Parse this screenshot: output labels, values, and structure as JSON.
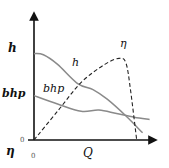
{
  "diagram": {
    "x_axis_label": "Q",
    "x_origin_label": "0",
    "y_axis_labels": {
      "h": "h",
      "bhp": "bhp",
      "eta": "η",
      "origin": "0"
    },
    "curve_labels": {
      "h": "h",
      "bhp": "bhp",
      "eta": "η"
    },
    "colors": {
      "axis": "#111111",
      "curve": "#8a8a8a",
      "eta_curve": "#222222"
    }
  },
  "chart_data": {
    "type": "line",
    "title": "",
    "xlabel": "Q",
    "ylabel": "",
    "xlim": [
      0,
      1
    ],
    "ylim": [
      0,
      1
    ],
    "grid": false,
    "series": [
      {
        "name": "h",
        "style": "solid",
        "x": [
          0,
          0.08,
          0.2,
          0.37,
          0.5,
          0.62,
          0.78,
          0.92
        ],
        "y": [
          0.72,
          0.71,
          0.63,
          0.47,
          0.42,
          0.34,
          0.2,
          0.06
        ]
      },
      {
        "name": "bhp",
        "style": "solid",
        "x": [
          0,
          0.2,
          0.4,
          0.55,
          0.7,
          0.85,
          0.98
        ],
        "y": [
          0.37,
          0.3,
          0.24,
          0.25,
          0.22,
          0.19,
          0.17
        ]
      },
      {
        "name": "η",
        "style": "dashed",
        "x": [
          0,
          0.2,
          0.4,
          0.6,
          0.72,
          0.78,
          0.82,
          0.87
        ],
        "y": [
          0,
          0.24,
          0.48,
          0.63,
          0.68,
          0.64,
          0.4,
          0.0
        ]
      }
    ]
  }
}
